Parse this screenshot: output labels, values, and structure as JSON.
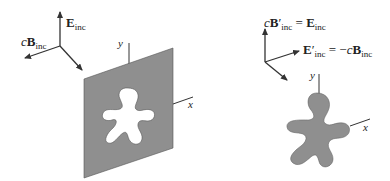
{
  "colors": {
    "plate_fill": "#8f8f8f",
    "shape_fill": "#8f8f8f",
    "line": "#333333",
    "background": "#ffffff"
  },
  "left_panel": {
    "description": "Opaque screen with aperture, incident field",
    "axes_triad": {
      "e_label": {
        "vec": "E",
        "sub": "inc"
      },
      "b_label": {
        "prefix": "c",
        "vec": "B",
        "sub": "inc"
      }
    },
    "plate_axes": {
      "y": "y",
      "x": "x"
    }
  },
  "right_panel": {
    "description": "Complementary screen (Babinet), rotated fields",
    "axes_triad": {
      "top_label": {
        "prefix": "c",
        "vec": "B",
        "prime": "′",
        "sub": "inc",
        "eq": " = ",
        "rhs_vec": "E",
        "rhs_sub": "inc"
      },
      "right_label": {
        "vec": "E",
        "prime": "′",
        "sub": "inc",
        "eq": " = −",
        "rhs_prefix": "c",
        "rhs_vec": "B",
        "rhs_sub": "inc"
      }
    },
    "shape_axes": {
      "y": "y",
      "x": "x"
    }
  }
}
